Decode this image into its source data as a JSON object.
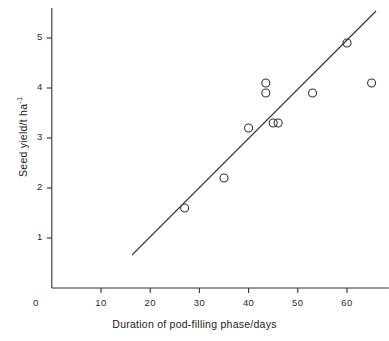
{
  "chart_data": {
    "type": "scatter",
    "title": "",
    "xlabel": "Duration of pod-filling phase/days",
    "ylabel": "Seed yield/t ha",
    "ylabel_exponent": "-1",
    "xlim": [
      0,
      68.5
    ],
    "ylim": [
      0,
      5.6
    ],
    "grid": false,
    "legend": null,
    "x_ticks": [
      {
        "value": 0,
        "label": "0"
      },
      {
        "value": 10,
        "label": "10"
      },
      {
        "value": 20,
        "label": "20"
      },
      {
        "value": 30,
        "label": "30"
      },
      {
        "value": 40,
        "label": "40"
      },
      {
        "value": 50,
        "label": "50"
      },
      {
        "value": 60,
        "label": "60"
      }
    ],
    "y_ticks": [
      {
        "value": 1,
        "label": "1"
      },
      {
        "value": 2,
        "label": "2"
      },
      {
        "value": 3,
        "label": "3"
      },
      {
        "value": 4,
        "label": "4"
      },
      {
        "value": 5,
        "label": "5"
      }
    ],
    "x": [
      27,
      35,
      40,
      43.5,
      43.5,
      45,
      46,
      53,
      60,
      65
    ],
    "y": [
      1.6,
      2.2,
      3.2,
      4.1,
      3.9,
      3.3,
      3.3,
      3.9,
      4.9,
      4.1
    ],
    "points": [
      {
        "x": 27,
        "y": 1.6
      },
      {
        "x": 35,
        "y": 2.2
      },
      {
        "x": 40,
        "y": 3.2
      },
      {
        "x": 43.5,
        "y": 4.1
      },
      {
        "x": 43.5,
        "y": 3.9
      },
      {
        "x": 45,
        "y": 3.3
      },
      {
        "x": 46,
        "y": 3.3
      },
      {
        "x": 53,
        "y": 3.9
      },
      {
        "x": 60,
        "y": 4.9
      },
      {
        "x": 65,
        "y": 4.1
      }
    ],
    "marker": {
      "shape": "open-circle",
      "radius_px": 4,
      "color": "#333333",
      "fill": "none"
    },
    "fit_line": {
      "type": "linear-regression",
      "x_start": 16.3,
      "y_start": 0.66,
      "x_end": 65.9,
      "y_end": 5.54,
      "color": "#333333"
    },
    "axis_color": "#333333"
  }
}
